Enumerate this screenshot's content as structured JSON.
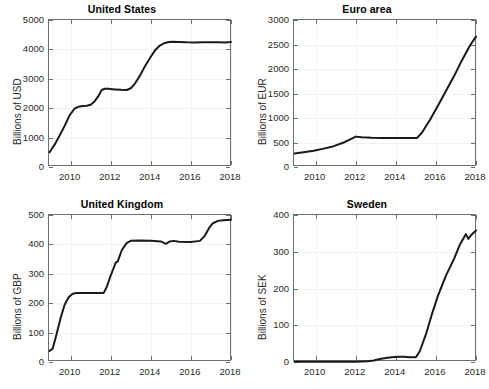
{
  "figure": {
    "background": "#ffffff",
    "axis_color": "#6e6e6e",
    "grid_color": "#f1f1f1",
    "line_color": "#1a1a1a",
    "text_color": "#2b2b2b",
    "title_color": "#000000",
    "width": 489,
    "height": 389
  },
  "chart_data": [
    {
      "type": "line",
      "panel": "top-left",
      "title": "United States",
      "xlabel": "",
      "ylabel": "Billions of USD",
      "xlim": [
        2008.92,
        2018.05
      ],
      "ylim": [
        0,
        5000
      ],
      "xticks": [
        2010,
        2012,
        2014,
        2016,
        2018
      ],
      "xtick_labels": [
        "2010",
        "2012",
        "2014",
        "2016",
        "2018"
      ],
      "yticks": [
        0,
        1000,
        2000,
        3000,
        4000,
        5000
      ],
      "ytick_labels": [
        "0",
        "1000",
        "2000",
        "3000",
        "4000",
        "5000"
      ],
      "grid": true,
      "legend": "none",
      "series": [
        {
          "name": "United States",
          "color": "#1a1a1a",
          "x": [
            2008.95,
            2009.2,
            2009.45,
            2009.7,
            2009.95,
            2010.2,
            2010.45,
            2010.6,
            2010.8,
            2011.0,
            2011.2,
            2011.4,
            2011.55,
            2011.7,
            2011.9,
            2012.2,
            2012.5,
            2012.8,
            2013.0,
            2013.2,
            2013.45,
            2013.7,
            2013.95,
            2014.2,
            2014.45,
            2014.7,
            2014.9,
            2015.1,
            2015.4,
            2015.8,
            2016.2,
            2016.6,
            2017.0,
            2017.4,
            2017.7,
            2018.0
          ],
          "y": [
            500,
            760,
            1070,
            1400,
            1760,
            1990,
            2060,
            2075,
            2085,
            2120,
            2240,
            2430,
            2620,
            2660,
            2660,
            2640,
            2625,
            2620,
            2680,
            2830,
            3100,
            3420,
            3700,
            3960,
            4130,
            4220,
            4250,
            4260,
            4255,
            4240,
            4235,
            4240,
            4245,
            4240,
            4235,
            4250
          ]
        }
      ]
    },
    {
      "type": "line",
      "panel": "top-right",
      "title": "Euro area",
      "xlabel": "",
      "ylabel": "Billions of EUR",
      "xlim": [
        2008.92,
        2018.05
      ],
      "ylim": [
        0,
        3000
      ],
      "xticks": [
        2010,
        2012,
        2014,
        2016,
        2018
      ],
      "xtick_labels": [
        "2010",
        "2012",
        "2014",
        "2016",
        "2018"
      ],
      "yticks": [
        0,
        500,
        1000,
        1500,
        2000,
        2500,
        3000
      ],
      "ytick_labels": [
        "0",
        "500",
        "1000",
        "1500",
        "2000",
        "2500",
        "3000"
      ],
      "grid": true,
      "legend": "none",
      "series": [
        {
          "name": "Euro area",
          "color": "#1a1a1a",
          "x": [
            2008.95,
            2009.4,
            2009.9,
            2010.4,
            2010.9,
            2011.4,
            2011.75,
            2012.0,
            2012.3,
            2012.8,
            2013.4,
            2014.0,
            2014.6,
            2015.05,
            2015.3,
            2015.7,
            2016.1,
            2016.5,
            2016.9,
            2017.3,
            2017.7,
            2018.0
          ],
          "y": [
            275,
            300,
            330,
            375,
            425,
            500,
            570,
            620,
            605,
            595,
            590,
            590,
            590,
            590,
            700,
            960,
            1250,
            1550,
            1850,
            2180,
            2480,
            2660
          ]
        }
      ]
    },
    {
      "type": "line",
      "panel": "bottom-left",
      "title": "United Kingdom",
      "xlabel": "",
      "ylabel": "Billions of GBP",
      "xlim": [
        2008.92,
        2018.05
      ],
      "ylim": [
        0,
        500
      ],
      "xticks": [
        2010,
        2012,
        2014,
        2016,
        2018
      ],
      "xtick_labels": [
        "2010",
        "2012",
        "2014",
        "2016",
        "2018"
      ],
      "yticks": [
        0,
        100,
        200,
        300,
        400,
        500
      ],
      "ytick_labels": [
        "0",
        "100",
        "200",
        "300",
        "400",
        "500"
      ],
      "grid": true,
      "legend": "none",
      "series": [
        {
          "name": "United Kingdom",
          "color": "#1a1a1a",
          "x": [
            2008.95,
            2009.1,
            2009.3,
            2009.5,
            2009.7,
            2009.9,
            2010.1,
            2010.3,
            2011.0,
            2011.65,
            2011.8,
            2011.95,
            2012.1,
            2012.25,
            2012.35,
            2012.55,
            2012.8,
            2013.0,
            2013.4,
            2014.0,
            2014.5,
            2014.75,
            2014.95,
            2015.15,
            2015.4,
            2016.0,
            2016.45,
            2016.7,
            2016.9,
            2017.1,
            2017.35,
            2017.6,
            2018.0
          ],
          "y": [
            38,
            45,
            95,
            150,
            195,
            220,
            232,
            235,
            235,
            235,
            255,
            285,
            312,
            338,
            342,
            380,
            405,
            412,
            413,
            412,
            410,
            402,
            410,
            412,
            409,
            408,
            412,
            430,
            455,
            472,
            480,
            482,
            484
          ]
        }
      ]
    },
    {
      "type": "line",
      "panel": "bottom-right",
      "title": "Sweden",
      "xlabel": "",
      "ylabel": "Billions of SEK",
      "xlim": [
        2008.92,
        2018.05
      ],
      "ylim": [
        0,
        400
      ],
      "xticks": [
        2010,
        2012,
        2014,
        2016,
        2018
      ],
      "xtick_labels": [
        "2010",
        "2012",
        "2014",
        "2016",
        "2018"
      ],
      "yticks": [
        0,
        100,
        200,
        300,
        400
      ],
      "ytick_labels": [
        "0",
        "100",
        "200",
        "300",
        "400"
      ],
      "grid": true,
      "legend": "none",
      "series": [
        {
          "name": "Sweden",
          "color": "#1a1a1a",
          "x": [
            2008.95,
            2010.0,
            2011.0,
            2012.0,
            2012.6,
            2012.9,
            2013.2,
            2013.5,
            2013.8,
            2014.1,
            2014.4,
            2014.7,
            2015.0,
            2015.2,
            2015.5,
            2015.8,
            2016.1,
            2016.5,
            2016.9,
            2017.2,
            2017.5,
            2017.62,
            2017.75,
            2018.0
          ],
          "y": [
            1,
            1,
            1,
            1,
            2,
            4,
            8,
            11,
            13,
            14,
            14,
            13,
            13,
            30,
            75,
            130,
            180,
            235,
            280,
            320,
            348,
            335,
            345,
            358
          ]
        }
      ]
    }
  ]
}
